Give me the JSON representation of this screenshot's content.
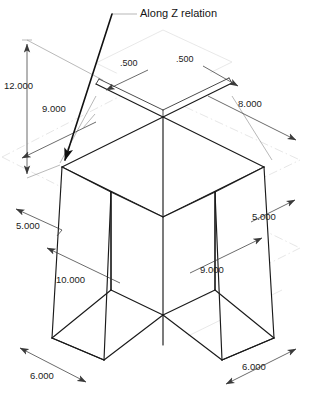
{
  "drawing": {
    "title_annotation": "Along Z relation",
    "plane_label": "Plane6",
    "units_note": "",
    "background_color": "#ffffff",
    "edge_color": "#1a1a1a",
    "dimension_color": "#3a3a3a",
    "construction_color": "#e0e0e0"
  },
  "dimensions": [
    {
      "id": "height-overall",
      "label": "12.000",
      "orientation": "vertical",
      "x": 30,
      "y": 86
    },
    {
      "id": "top-left-width",
      "label": "9.000",
      "orientation": "iso-left",
      "x": 62,
      "y": 109
    },
    {
      "id": "top-right-width",
      "label": "8.000",
      "orientation": "iso-right",
      "x": 258,
      "y": 104
    },
    {
      "id": "plate-thk-left",
      "label": ".500",
      "orientation": "iso-left",
      "x": 133,
      "y": 64
    },
    {
      "id": "plate-thk-right",
      "label": ".500",
      "orientation": "iso-right",
      "x": 190,
      "y": 60
    },
    {
      "id": "mid-left-depth",
      "label": "5.000",
      "orientation": "iso-left",
      "x": 33,
      "y": 226
    },
    {
      "id": "mid-right-depth",
      "label": "5.000",
      "orientation": "iso-right",
      "x": 270,
      "y": 217
    },
    {
      "id": "lower-left-length",
      "label": "10.000",
      "orientation": "iso-left",
      "x": 81,
      "y": 280
    },
    {
      "id": "lower-right-length",
      "label": "9.000",
      "orientation": "iso-right",
      "x": 221,
      "y": 270
    },
    {
      "id": "base-left-width",
      "label": "6.000",
      "orientation": "iso-left",
      "x": 50,
      "y": 376
    },
    {
      "id": "base-right-width",
      "label": "6.000",
      "orientation": "iso-right",
      "x": 264,
      "y": 367
    }
  ],
  "geometry": {
    "type": "isometric-solid",
    "description": "cross-shaped extruded prism with thin top plate"
  }
}
